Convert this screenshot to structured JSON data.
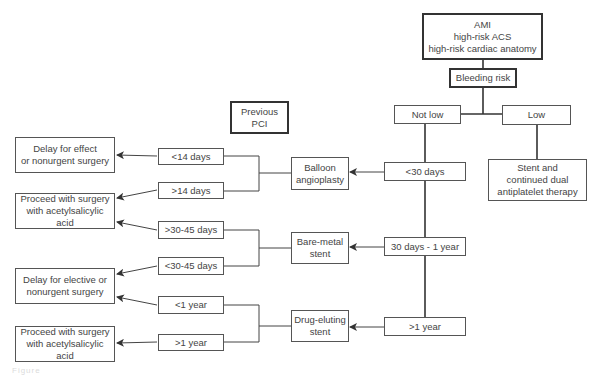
{
  "root": {
    "label": "AMI\nhigh-risk ACS\nhigh-risk cardiac anatomy"
  },
  "bleeding_risk": {
    "label": "Bleeding risk"
  },
  "branches": {
    "not_low": {
      "label": "Not low"
    },
    "low": {
      "label": "Low"
    }
  },
  "low_outcome": {
    "label": "Stent and\ncontinued dual\nantiplatelet therapy"
  },
  "previous_pci": {
    "label": "Previous\nPCI"
  },
  "timing": [
    {
      "label": "<30 days"
    },
    {
      "label": "30 days - 1 year"
    },
    {
      "label": ">1 year"
    }
  ],
  "pci_types": [
    {
      "label": "Balloon\nangioplasty"
    },
    {
      "label": "Bare-metal\nstent"
    },
    {
      "label": "Drug-eluting\nstent"
    }
  ],
  "intervals": [
    {
      "label": "<14 days"
    },
    {
      "label": ">14 days"
    },
    {
      "label": ">30-45 days"
    },
    {
      "label": "<30-45 days"
    },
    {
      "label": "<1 year"
    },
    {
      "label": ">1 year"
    }
  ],
  "outcomes": [
    {
      "label": "Delay for effect\nor nonurgent surgery"
    },
    {
      "label": "Proceed with surgery\nwith acetylsalicylic acid"
    },
    {
      "label": "Delay for elective or\nnonurgent surgery"
    },
    {
      "label": "Proceed with surgery\nwith acetylsalicylic acid"
    }
  ],
  "caption": {
    "text": "Figure"
  }
}
